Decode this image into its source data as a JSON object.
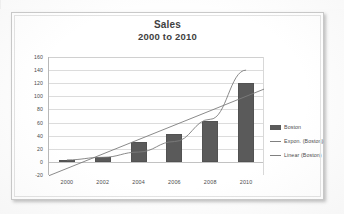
{
  "chart_data": {
    "type": "bar",
    "title": "Sales",
    "subtitle": "2000 to 2010",
    "xlabel": "",
    "ylabel": "",
    "categories": [
      "2000",
      "2002",
      "2004",
      "2006",
      "2008",
      "2010"
    ],
    "values": [
      3,
      7,
      30,
      42,
      62,
      121
    ],
    "series": [
      {
        "name": "Boston",
        "type": "bar",
        "values": [
          3,
          7,
          30,
          42,
          62,
          121
        ]
      },
      {
        "name": "Expon. (Boston)",
        "type": "line",
        "values": [
          3,
          7,
          15,
          31,
          65,
          140
        ]
      },
      {
        "name": "Linear (Boston)",
        "type": "line",
        "values": [
          -10,
          12,
          34,
          56,
          78,
          100
        ]
      }
    ],
    "ylim": [
      -20,
      160
    ],
    "ytick_step": 20,
    "yticks": [
      "160",
      "140",
      "120",
      "100",
      "80",
      "60",
      "40",
      "20",
      "0",
      "-20"
    ],
    "grid": true,
    "legend_position": "right",
    "legend": [
      "Boston",
      "Expon. (Boston)",
      "Linear (Boston)"
    ],
    "colors": {
      "bar": "#5a5a5a",
      "trendline": "#808080",
      "gridline": "#dcdcdc",
      "text": "#4a4a4a",
      "title": "#3f3f3f"
    }
  },
  "legend": {
    "items": [
      {
        "label": "Boston",
        "marker": "bar-swatch"
      },
      {
        "label": "Expon. (Boston)",
        "marker": "line-swatch"
      },
      {
        "label": "Linear (Boston)",
        "marker": "line-swatch"
      }
    ]
  }
}
